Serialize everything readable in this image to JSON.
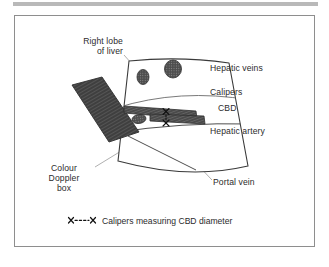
{
  "figure": {
    "labels": {
      "right_lobe": "Right lobe\nof liver",
      "hepatic_veins": "Hepatic veins",
      "calipers": "Calipers",
      "cbd": "CBD",
      "hepatic_artery": "Hepatic artery",
      "portal_vein": "Portal vein",
      "colour_doppler_box": "Colour\nDoppler\nbox"
    },
    "legend": {
      "glyph_name": "caliper-marker-glyph",
      "glyph_text": "×---×",
      "caption": "Calipers measuring CBD diameter"
    },
    "colors": {
      "frame_border": "#8e8e8e",
      "top_bar": "#b9b9b9",
      "outline": "#3a3a3a",
      "leader_line": "#9a9a9a",
      "vessel_fill": "#4a4a4a",
      "hatch_dark": "#3f3f3f",
      "text": "#2b2b2b",
      "background": "#ffffff"
    }
  }
}
